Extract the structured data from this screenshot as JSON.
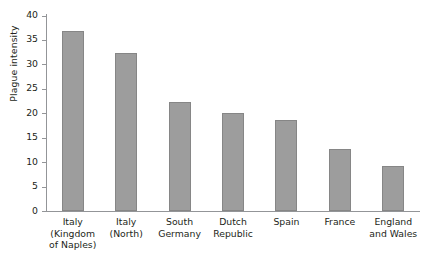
{
  "chart_data": {
    "type": "bar",
    "title": "",
    "subtitle": "",
    "xlabel": "",
    "ylabel": "Plague intensity",
    "ylim": [
      0,
      40
    ],
    "yticks": [
      0,
      5,
      10,
      15,
      20,
      25,
      30,
      35,
      40
    ],
    "ytick_labels": [
      "0",
      "5",
      "10",
      "15",
      "20",
      "25",
      "30",
      "35",
      "40"
    ],
    "grid": false,
    "legend": null,
    "bar_color": "#9d9d9d",
    "bar_edge_color": "#868686",
    "axis_color": "#939598",
    "text_color": "#231f20",
    "categories": [
      "Italy (Kingdom of Naples)",
      "Italy (North)",
      "South Germany",
      "Dutch Republic",
      "Spain",
      "France",
      "England and Wales"
    ],
    "category_lines": [
      [
        "Italy",
        "(Kingdom",
        "of Naples)"
      ],
      [
        "Italy",
        "(North)"
      ],
      [
        "South",
        "Germany"
      ],
      [
        "Dutch",
        "Republic"
      ],
      [
        "Spain"
      ],
      [
        "France"
      ],
      [
        "England",
        "and Wales"
      ]
    ],
    "values": [
      36.8,
      32.3,
      22.3,
      20.0,
      18.6,
      12.7,
      9.3
    ]
  }
}
